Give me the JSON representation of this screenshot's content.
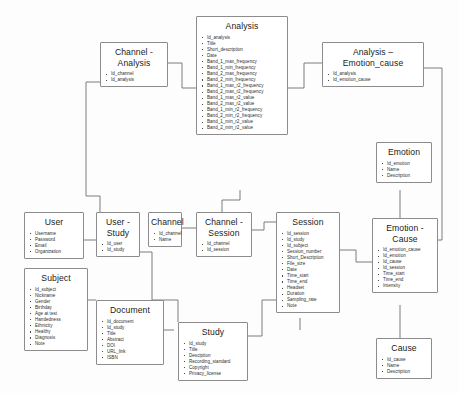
{
  "diagram": {
    "line_color": "#6e6e6e",
    "box_border_color": "#8c8c8c",
    "background": "#fdfdfd"
  },
  "entities": {
    "analysis": {
      "title": "Analysis",
      "fields": [
        "Id_analysis",
        "Title",
        "Short_description",
        "Date",
        "Band_1_max_frequency",
        "Band_1_min_frequency",
        "Band_2_max_frequency",
        "Band_2_min_frequency",
        "Band_1_max_r2_frequency",
        "Band_2_max_r2_frequency",
        "Band_1_max_r2_value",
        "Band_2_max_r2_value",
        "Band_1_min_r2_frequency",
        "Band_2_min_r2_frequency",
        "Band_1_min_r2_value",
        "Band_2_min_r2_value"
      ]
    },
    "channel_analysis": {
      "title": "Channel - Analysis",
      "title_line_1": "Channel -",
      "title_line_2": "Analysis",
      "fields": [
        "Id_channel",
        "Id_analysis"
      ]
    },
    "analysis_emotion_cause": {
      "title": "Analysis – Emotion_cause",
      "title_line_1": "Analysis –",
      "title_line_2": "Emotion_cause",
      "fields": [
        "Id_analysis",
        "Id_emotion_cause"
      ]
    },
    "emotion": {
      "title": "Emotion",
      "fields": [
        "Id_emotion",
        "Name",
        "Description"
      ]
    },
    "emotion_cause": {
      "title": "Emotion - Cause",
      "title_line_1": "Emotion -",
      "title_line_2": "Cause",
      "fields": [
        "Id_emotion_cause",
        "Id_emotion",
        "Id_cause",
        "Id_session",
        "Time_start",
        "Time_end",
        "Intensity"
      ]
    },
    "cause": {
      "title": "Cause",
      "fields": [
        "Id_cause",
        "Name",
        "Description"
      ]
    },
    "user": {
      "title": "User",
      "fields": [
        "Username",
        "Password",
        "Email",
        "Organization"
      ]
    },
    "user_study": {
      "title": "User - Study",
      "title_line_1": "User -",
      "title_line_2": "Study",
      "fields": [
        "Id_user",
        "Id_study"
      ]
    },
    "channel": {
      "title": "Channel",
      "fields": [
        "Id_channel",
        "Name"
      ]
    },
    "channel_session": {
      "title": "Channel - Session",
      "title_line_1": "Channel -",
      "title_line_2": "Session",
      "fields": [
        "Id_channel",
        "Id_session"
      ]
    },
    "session": {
      "title": "Session",
      "fields": [
        "Id_session",
        "Id_study",
        "Id_subject",
        "Session_number",
        "Short_Description",
        "File_size",
        "Date",
        "Time_start",
        "Time_end",
        "Headset",
        "Duration",
        "Sampling_rate",
        "Note"
      ]
    },
    "subject": {
      "title": "Subject",
      "fields": [
        "Id_subject",
        "Nickname",
        "Gender",
        "Birthday",
        "Age at test",
        "Handedness",
        "Ethnicity",
        "Healthy",
        "Diagnosis",
        "Note"
      ]
    },
    "document": {
      "title": "Document",
      "fields": [
        "Id_document",
        "Id_study",
        "Title",
        "Abstract",
        "DOI",
        "URL_link",
        "ISBN"
      ]
    },
    "study": {
      "title": "Study",
      "fields": [
        "Id_study",
        "Title",
        "Desciption",
        "Recording_standard",
        "Copyright",
        "Privacy_license"
      ]
    }
  }
}
